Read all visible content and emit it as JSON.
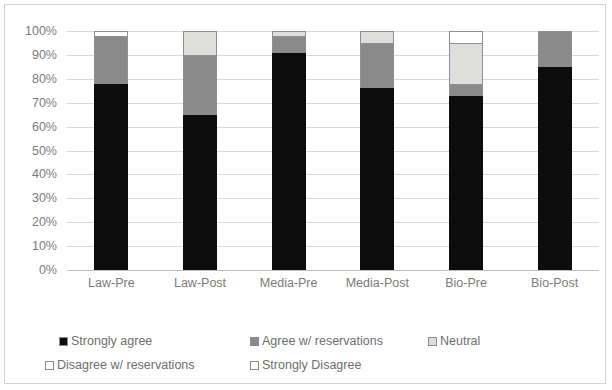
{
  "chart_data": {
    "type": "bar",
    "subtype": "stacked-100-percent",
    "title": "",
    "xlabel": "",
    "ylabel": "",
    "ylim": [
      0,
      100
    ],
    "ytick_labels": [
      "100%",
      "90%",
      "80%",
      "70%",
      "60%",
      "50%",
      "40%",
      "30%",
      "20%",
      "10%",
      "0%"
    ],
    "ytick_values": [
      100,
      90,
      80,
      70,
      60,
      50,
      40,
      30,
      20,
      10,
      0
    ],
    "grid": true,
    "legend_position": "bottom",
    "categories": [
      "Law-Pre",
      "Law-Post",
      "Media-Pre",
      "Media-Post",
      "Bio-Pre",
      "Bio-Post"
    ],
    "series": [
      {
        "name": "Strongly agree",
        "color": "#0d0d0d",
        "values": [
          78,
          65,
          91,
          76,
          73,
          85
        ]
      },
      {
        "name": "Agree w/ reservations",
        "color": "#8a8a8a",
        "values": [
          20,
          25,
          7,
          19,
          5,
          15
        ]
      },
      {
        "name": "Neutral",
        "color": "#dededd",
        "values": [
          0,
          10,
          2,
          5,
          17,
          0
        ]
      },
      {
        "name": "Disagree w/ reservations",
        "color": "#ffffff",
        "values": [
          2,
          0,
          0,
          0,
          5,
          0
        ]
      },
      {
        "name": "Strongly Disagree",
        "color": "#ffffff",
        "values": [
          0,
          0,
          0,
          0,
          0,
          0
        ]
      }
    ]
  },
  "legend": {
    "items": [
      {
        "label": "Strongly agree",
        "color": "#0d0d0d"
      },
      {
        "label": "Agree w/ reservations",
        "color": "#8a8a8a"
      },
      {
        "label": "Neutral",
        "color": "#dededd"
      },
      {
        "label": "Disagree w/ reservations",
        "color": "#ffffff"
      },
      {
        "label": "Strongly Disagree",
        "color": "#ffffff"
      }
    ]
  }
}
